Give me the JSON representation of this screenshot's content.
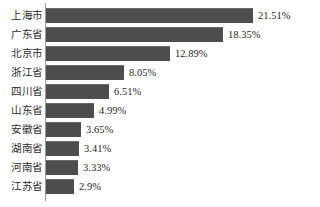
{
  "chart_data": {
    "type": "bar",
    "orientation": "horizontal",
    "title": "",
    "subtitle": "",
    "xlabel": "",
    "ylabel": "",
    "grid": false,
    "legend": null,
    "xlim": [
      0,
      21.51
    ],
    "value_suffix": "%",
    "bar_color": "#4d4d4d",
    "axis_color": "#9a9a9a",
    "background_color": "#ffffff",
    "categories": [
      "上海市",
      "广东省",
      "北京市",
      "浙江省",
      "四川省",
      "山东省",
      "安徽省",
      "湖南省",
      "河南省",
      "江苏省"
    ],
    "values": [
      21.51,
      18.35,
      12.89,
      8.05,
      6.51,
      4.99,
      3.65,
      3.41,
      3.33,
      2.9
    ],
    "value_labels": [
      "21.51%",
      "18.35%",
      "12.89%",
      "8.05%",
      "6.51%",
      "4.99%",
      "3.65%",
      "3.41%",
      "3.33%",
      "2.9%"
    ],
    "bars": [
      {
        "category": "上海市",
        "value": 21.51,
        "label": "21.51%",
        "width_px": 207
      },
      {
        "category": "广东省",
        "value": 18.35,
        "label": "18.35%",
        "width_px": 177
      },
      {
        "category": "北京市",
        "value": 12.89,
        "label": "12.89%",
        "width_px": 124
      },
      {
        "category": "浙江省",
        "value": 8.05,
        "label": "8.05%",
        "width_px": 78
      },
      {
        "category": "四川省",
        "value": 6.51,
        "label": "6.51%",
        "width_px": 63
      },
      {
        "category": "山东省",
        "value": 4.99,
        "label": "4.99%",
        "width_px": 48
      },
      {
        "category": "安徽省",
        "value": 3.65,
        "label": "3.65%",
        "width_px": 35
      },
      {
        "category": "湖南省",
        "value": 3.41,
        "label": "3.41%",
        "width_px": 33
      },
      {
        "category": "河南省",
        "value": 3.33,
        "label": "3.33%",
        "width_px": 32
      },
      {
        "category": "江苏省",
        "value": 2.9,
        "label": "2.9%",
        "width_px": 28
      }
    ]
  }
}
